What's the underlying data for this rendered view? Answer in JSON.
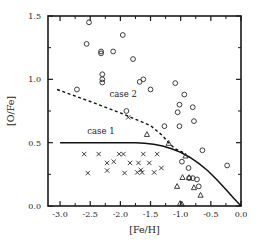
{
  "chart_data": {
    "type": "scatter",
    "title": "",
    "xlabel": "[Fe/H]",
    "ylabel": "[O/Fe]",
    "xlim": [
      -3.2,
      0.0
    ],
    "ylim": [
      0.0,
      1.5
    ],
    "grid": false,
    "legend_position": "inline-annotations",
    "xticks": [
      -3.0,
      -2.5,
      -2.0,
      -1.5,
      -1.0,
      -0.5,
      0.0
    ],
    "xticklabels": [
      "-3.0",
      "-2.5",
      "-2.0",
      "-1.5",
      "-1.0",
      "-0.5",
      "0.0"
    ],
    "yticks": [
      0.0,
      0.5,
      1.0,
      1.5
    ],
    "yticklabels": [
      "0.0",
      "0.5",
      "1.0",
      "1.5"
    ],
    "xminorticks": [
      -2.75,
      -2.25,
      -1.75,
      -1.25,
      -0.75,
      -0.25
    ],
    "yminorticks": [
      0.25,
      0.75,
      1.25
    ],
    "annotations": [
      {
        "text": "case 1",
        "x": -2.55,
        "y": 0.565
      },
      {
        "text": "case 2",
        "x": -2.18,
        "y": 0.86
      }
    ],
    "series": [
      {
        "name": "open-circles",
        "marker": "circle",
        "points": [
          [
            -2.52,
            1.45
          ],
          [
            -2.56,
            1.28
          ],
          [
            -2.32,
            1.22
          ],
          [
            -2.32,
            1.205
          ],
          [
            -2.12,
            1.22
          ],
          [
            -1.96,
            1.35
          ],
          [
            -1.79,
            1.16
          ],
          [
            -2.3,
            1.04
          ],
          [
            -2.3,
            1.0
          ],
          [
            -2.3,
            0.975
          ],
          [
            -1.62,
            1.0
          ],
          [
            -1.68,
            0.98
          ],
          [
            -1.5,
            0.92
          ],
          [
            -1.09,
            0.97
          ],
          [
            -2.72,
            0.92
          ],
          [
            -1.9,
            0.75
          ],
          [
            -0.94,
            0.88
          ],
          [
            -1.02,
            0.8
          ],
          [
            -1.05,
            0.74
          ],
          [
            -0.8,
            0.78
          ],
          [
            -1.27,
            0.63
          ],
          [
            -1.02,
            0.63
          ],
          [
            -0.78,
            0.67
          ],
          [
            -0.64,
            0.44
          ],
          [
            -0.23,
            0.32
          ],
          [
            -0.87,
            0.3
          ],
          [
            -0.98,
            0.35
          ],
          [
            -0.86,
            0.22
          ],
          [
            -0.73,
            0.21
          ],
          [
            -0.8,
            0.22
          ],
          [
            -0.7,
            0.155
          ]
        ]
      },
      {
        "name": "crosses",
        "marker": "x",
        "points": [
          [
            -2.6,
            0.41
          ],
          [
            -2.36,
            0.41
          ],
          [
            -2.11,
            0.35
          ],
          [
            -2.02,
            0.41
          ],
          [
            -1.95,
            0.41
          ],
          [
            -1.62,
            0.41
          ],
          [
            -1.39,
            0.41
          ],
          [
            -2.22,
            0.34
          ],
          [
            -1.84,
            0.34
          ],
          [
            -1.7,
            0.34
          ],
          [
            -1.52,
            0.34
          ],
          [
            -1.66,
            0.285
          ],
          [
            -1.32,
            0.3
          ],
          [
            -2.54,
            0.26
          ],
          [
            -2.22,
            0.28
          ],
          [
            -1.93,
            0.26
          ],
          [
            -1.72,
            0.265
          ],
          [
            -1.64,
            0.265
          ],
          [
            -1.44,
            0.265
          ],
          [
            -1.87,
            0.7
          ]
        ]
      },
      {
        "name": "triangles",
        "marker": "triangle",
        "points": [
          [
            -1.56,
            0.565
          ],
          [
            -1.2,
            0.495
          ],
          [
            -0.92,
            0.395
          ],
          [
            -0.86,
            0.225
          ],
          [
            -0.97,
            0.225
          ],
          [
            -1.06,
            0.155
          ],
          [
            -0.78,
            0.145
          ],
          [
            -0.67,
            0.085
          ],
          [
            -0.98,
            0.015
          ],
          [
            -1.01,
            0.02
          ]
        ]
      }
    ],
    "curves": [
      {
        "name": "case 1",
        "style": "solid",
        "points": [
          [
            -3.0,
            0.5
          ],
          [
            -2.5,
            0.5
          ],
          [
            -2.0,
            0.5
          ],
          [
            -1.75,
            0.5
          ],
          [
            -1.6,
            0.495
          ],
          [
            -1.45,
            0.487
          ],
          [
            -1.3,
            0.473
          ],
          [
            -1.15,
            0.452
          ],
          [
            -1.0,
            0.423
          ],
          [
            -0.85,
            0.385
          ],
          [
            -0.7,
            0.337
          ],
          [
            -0.55,
            0.278
          ],
          [
            -0.4,
            0.208
          ],
          [
            -0.25,
            0.131
          ],
          [
            -0.12,
            0.061
          ],
          [
            0.0,
            0.0
          ]
        ]
      },
      {
        "name": "case 2",
        "style": "dashed",
        "points": [
          [
            -3.05,
            0.92
          ],
          [
            -2.5,
            0.825
          ],
          [
            -2.0,
            0.735
          ],
          [
            -1.5,
            0.635
          ],
          [
            -1.3,
            0.555
          ],
          [
            -1.2,
            0.5
          ],
          [
            -1.1,
            0.455
          ],
          [
            -0.95,
            0.42
          ]
        ]
      }
    ]
  },
  "figure": {
    "background_color": "#ffffff",
    "axis_color": "#1a1a1a",
    "marker_color": "#2a2a2a",
    "curve_color": "#111111"
  }
}
